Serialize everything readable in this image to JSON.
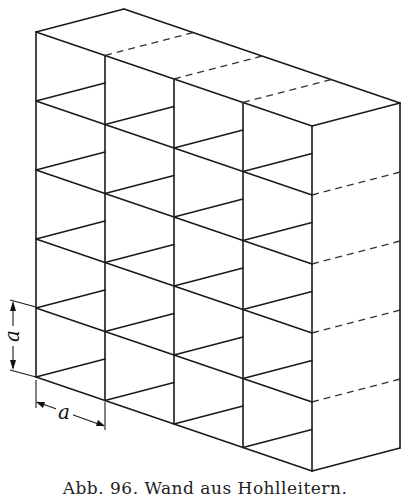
{
  "figure": {
    "caption": "Abb. 96. Wand aus Hohlleitern.",
    "dimension_label_vertical": "a",
    "dimension_label_horizontal": "a",
    "line_color": "#1a1a1a",
    "background": "#ffffff",
    "geometry": {
      "front_origin": [
        36,
        32
      ],
      "column_step": [
        69,
        23.5
      ],
      "row_step": 69,
      "depth_vector": [
        88,
        -23
      ],
      "columns": 4,
      "rows": 5
    }
  }
}
